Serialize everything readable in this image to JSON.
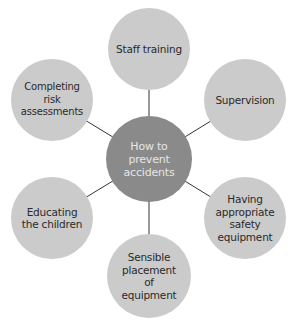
{
  "diagram": {
    "title": "How to prevent accidents",
    "center": {
      "label": "How to\nprevent\naccidents",
      "x": 149,
      "y": 159,
      "r": 43
    },
    "nodes": [
      {
        "id": "staff-training",
        "label": "Staff training",
        "x": 149,
        "y": 49,
        "r": 41
      },
      {
        "id": "supervision",
        "label": "Supervision",
        "x": 245,
        "y": 100,
        "r": 41
      },
      {
        "id": "safety-equipment",
        "label": "Having appropriate safety equipment",
        "x": 245,
        "y": 218,
        "r": 41
      },
      {
        "id": "sensible-placement",
        "label": "Sensible placement of equipment",
        "x": 149,
        "y": 276,
        "r": 42
      },
      {
        "id": "educating-children",
        "label": "Educating the children",
        "x": 52,
        "y": 218,
        "r": 41
      },
      {
        "id": "risk-assessments",
        "label": "Completing risk assessments",
        "x": 52,
        "y": 100,
        "r": 41
      }
    ],
    "colors": {
      "center_fill": "#8a8a8a",
      "center_text": "#e6e6e6",
      "node_fill": "#cbcbcb",
      "node_text": "#2a2a2a",
      "connector": "#333333"
    }
  }
}
